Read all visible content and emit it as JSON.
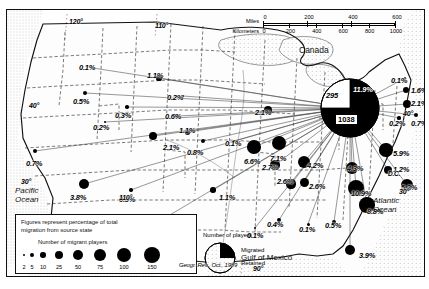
{
  "figure": {
    "attribution": "Geogr. Rev., Oct., 1989",
    "regions": {
      "canada": "Canada",
      "pacific": "Pacific\nOcean",
      "atlantic": "Atlantic\nOcean",
      "gulf": "Gulf of Mexico"
    }
  },
  "scale": {
    "miles_label": "Miles",
    "km_label": "Kilometers",
    "miles_ticks": [
      "0",
      "200",
      "400",
      "600"
    ],
    "km_ticks": [
      "0",
      "200",
      "400",
      "600",
      "800",
      "1000"
    ]
  },
  "graticule": {
    "longitudes": [
      "120°",
      "110°",
      "110°",
      "90°"
    ],
    "latitudes": [
      "40°",
      "30°",
      "40°",
      "30°"
    ]
  },
  "legend": {
    "note_line1": "Figures represent percentage of total",
    "note_line2": "migration from source state",
    "dot_title": "Number of migrant players",
    "dot_values": [
      "2",
      "5",
      "10",
      "25",
      "50",
      "75",
      "100",
      "150"
    ],
    "pie_title": "Number of players",
    "pie_migrated": "Migrated",
    "pie_retained": "Retained"
  },
  "focus_pie": {
    "migrated_count": "1038",
    "retained_count": "295",
    "share_label": "11.9%"
  },
  "chart_data": {
    "type": "map",
    "units": "percentage of total migration from source state",
    "points": [
      {
        "label": "0.1%",
        "value": 0.1,
        "x": 86,
        "y": 58,
        "r": 0,
        "lx": 72,
        "ly": 54
      },
      {
        "label": "0.5%",
        "value": 0.5,
        "x": 78,
        "y": 83,
        "r": 2.2,
        "lx": 66,
        "ly": 88
      },
      {
        "label": "0.3%",
        "value": 0.3,
        "x": 120,
        "y": 97,
        "r": 1.8,
        "lx": 108,
        "ly": 102
      },
      {
        "label": "0.2%",
        "value": 0.2,
        "x": 98,
        "y": 112,
        "r": 1.4,
        "lx": 86,
        "ly": 114
      },
      {
        "label": "0.7%",
        "value": 0.7,
        "x": 28,
        "y": 141,
        "r": 2.4,
        "lx": 19,
        "ly": 150
      },
      {
        "label": "3.8%",
        "value": 3.8,
        "x": 77,
        "y": 174,
        "r": 5.4,
        "lx": 63,
        "ly": 184
      },
      {
        "label": "0.3%",
        "value": 0.3,
        "x": 124,
        "y": 180,
        "r": 1.7,
        "lx": 112,
        "ly": 186
      },
      {
        "label": "0.9%",
        "value": 0.9,
        "x": 146,
        "y": 215,
        "r": 3.0,
        "lx": 126,
        "ly": 216
      },
      {
        "label": "1.1%",
        "value": 1.1,
        "x": 152,
        "y": 68,
        "r": 2.6,
        "lx": 140,
        "ly": 62
      },
      {
        "label": "0.2%",
        "value": 0.2,
        "x": 176,
        "y": 86,
        "r": 1.3,
        "lx": 160,
        "ly": 84
      },
      {
        "label": "0.6%",
        "value": 0.6,
        "x": 170,
        "y": 106,
        "r": 2.2,
        "lx": 158,
        "ly": 103
      },
      {
        "label": "2.1%",
        "value": 2.1,
        "x": 146,
        "y": 126,
        "r": 4.1,
        "lx": 156,
        "ly": 134
      },
      {
        "label": "1.1%",
        "value": 1.1,
        "x": 180,
        "y": 122,
        "r": 2.5,
        "lx": 172,
        "ly": 117
      },
      {
        "label": "0.8%",
        "value": 0.8,
        "x": 196,
        "y": 131,
        "r": 2.4,
        "lx": 180,
        "ly": 139
      },
      {
        "label": "0.1%",
        "value": 0.1,
        "x": 227,
        "y": 131,
        "r": 1.4,
        "lx": 218,
        "ly": 130
      },
      {
        "label": "1.1%",
        "value": 1.1,
        "x": 206,
        "y": 180,
        "r": 2.7,
        "lx": 212,
        "ly": 184
      },
      {
        "label": "2.1%",
        "value": 2.1,
        "x": 261,
        "y": 100,
        "r": 4.4,
        "lx": 248,
        "ly": 99
      },
      {
        "label": "6.6%",
        "value": 6.6,
        "x": 247,
        "y": 137,
        "r": 6.8,
        "lx": 237,
        "ly": 148
      },
      {
        "label": "7.1%",
        "value": 7.1,
        "x": 272,
        "y": 133,
        "r": 7.2,
        "lx": 263,
        "ly": 145
      },
      {
        "label": "2.7%",
        "value": 2.7,
        "x": 268,
        "y": 155,
        "r": 4.6,
        "lx": 255,
        "ly": 154
      },
      {
        "label": "4.2%",
        "value": 4.2,
        "x": 297,
        "y": 152,
        "r": 6.0,
        "lx": 300,
        "ly": 152
      },
      {
        "label": "2.6%",
        "value": 2.6,
        "x": 297,
        "y": 172,
        "r": 4.5,
        "lx": 302,
        "ly": 173
      },
      {
        "label": "2.6%",
        "value": 2.6,
        "x": 284,
        "y": 174,
        "r": 4.6,
        "lx": 270,
        "ly": 168
      },
      {
        "label": "0.4%",
        "value": 0.4,
        "x": 272,
        "y": 210,
        "r": 1.9,
        "lx": 260,
        "ly": 211
      },
      {
        "label": "0.1%",
        "value": 0.1,
        "x": 301,
        "y": 214,
        "r": 1.5,
        "lx": 292,
        "ly": 216
      },
      {
        "label": "0.5%",
        "value": 0.5,
        "x": 327,
        "y": 212,
        "r": 2.1,
        "lx": 318,
        "ly": 212
      },
      {
        "label": "0.1%",
        "value": 0.1,
        "x": 248,
        "y": 218,
        "r": 1.3,
        "lx": 240,
        "ly": 222
      },
      {
        "label": "3.9%",
        "value": 3.9,
        "x": 343,
        "y": 240,
        "r": 5.4,
        "lx": 352,
        "ly": 242
      },
      {
        "label": "4.3%",
        "value": 4.3,
        "x": 345,
        "y": 158,
        "r": 6.2,
        "lx": 340,
        "ly": 155
      },
      {
        "label": "10.9%",
        "value": 10.9,
        "x": 349,
        "y": 178,
        "r": 8.4,
        "lx": 344,
        "ly": 180
      },
      {
        "label": "8.8%",
        "value": 8.8,
        "x": 360,
        "y": 195,
        "r": 7.6,
        "lx": 360,
        "ly": 198
      },
      {
        "label": "5.9%",
        "value": 5.9,
        "x": 379,
        "y": 140,
        "r": 6.6,
        "lx": 386,
        "ly": 140
      },
      {
        "label": "1.2%",
        "value": 1.2,
        "x": 381,
        "y": 160,
        "r": 4.4,
        "lx": 386,
        "ly": 156
      },
      {
        "label": "5.2%",
        "value": 5.2,
        "x": 400,
        "y": 175,
        "r": 6.0,
        "lx": 394,
        "ly": 174
      },
      {
        "label": "0.1%",
        "value": 0.1,
        "x": 398,
        "y": 68,
        "r": 1.4,
        "lx": 384,
        "ly": 67
      },
      {
        "label": "1.6%",
        "value": 1.6,
        "x": 399,
        "y": 80,
        "r": 3.4,
        "lx": 404,
        "ly": 77
      },
      {
        "label": "2.1%",
        "value": 2.1,
        "x": 400,
        "y": 94,
        "r": 4.0,
        "lx": 404,
        "ly": 90
      },
      {
        "label": "0.2%",
        "value": 0.2,
        "x": 392,
        "y": 108,
        "r": 1.6,
        "lx": 382,
        "ly": 110
      },
      {
        "label": "0.7%",
        "value": 0.7,
        "x": 409,
        "y": 105,
        "r": 2.4,
        "lx": 404,
        "ly": 110
      }
    ],
    "dc_label": "D.C.",
    "center": {
      "x": 343,
      "y": 98,
      "r": 29
    }
  }
}
